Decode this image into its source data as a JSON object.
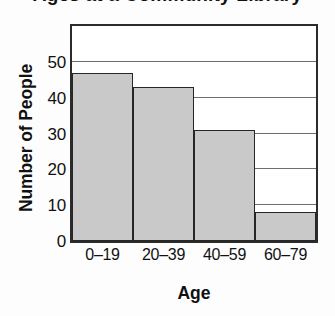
{
  "chart_data": {
    "type": "bar",
    "title": "Ages at a Community Library",
    "title_truncated": true,
    "xlabel": "Age",
    "ylabel": "Number of People",
    "categories": [
      "0–19",
      "20–39",
      "40–59",
      "60–79"
    ],
    "values": [
      47,
      43,
      31,
      8
    ],
    "series": [
      {
        "name": "Number of People",
        "values": [
          47,
          43,
          31,
          8
        ]
      }
    ],
    "ylim": [
      0,
      60
    ],
    "yticks": [
      0,
      10,
      20,
      30,
      40,
      50
    ],
    "ytick_labels": [
      "0",
      "10",
      "20",
      "30",
      "40",
      "50"
    ],
    "gridlines": [
      10,
      20,
      30,
      40,
      50
    ],
    "grid": true,
    "legend": null,
    "legend_position": "none",
    "bar_fill_color": "#c9c9c9",
    "bar_edge_color": "#262626",
    "axis_color": "#2b2b2b",
    "grid_color": "#6e6e6e",
    "background_color": "#ffffff",
    "bar_gap": 0
  }
}
